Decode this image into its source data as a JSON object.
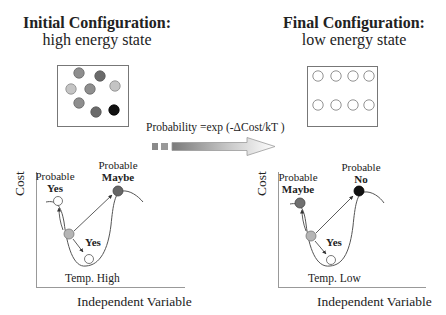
{
  "left": {
    "title_line1": "Initial Configuration:",
    "title_line2": "high energy state",
    "config_particles": [
      {
        "shade": "medium"
      },
      {
        "shade": "dark"
      },
      {
        "shade": "light"
      },
      {
        "shade": "medium"
      },
      {
        "shade": "light"
      },
      {
        "shade": "medium"
      },
      {
        "shade": "dark"
      },
      {
        "shade": "black"
      }
    ],
    "graph": {
      "y_axis_label": "Cost",
      "x_axis_label": "Independent Variable",
      "temperature_label": "Temp. High",
      "uphill_left_label_line1": "Probable",
      "uphill_left_label_line2": "Yes",
      "uphill_right_label_line1": "Probable",
      "uphill_right_label_line2": "Maybe",
      "downhill_label": "Yes"
    }
  },
  "right": {
    "title_line1": "Final Configuration:",
    "title_line2": "low energy state",
    "config_particles": [
      {
        "shade": "empty"
      },
      {
        "shade": "empty"
      },
      {
        "shade": "empty"
      },
      {
        "shade": "empty"
      },
      {
        "shade": "empty"
      },
      {
        "shade": "empty"
      },
      {
        "shade": "empty"
      },
      {
        "shade": "empty"
      }
    ],
    "graph": {
      "y_axis_label": "Cost",
      "x_axis_label": "Independent Variable",
      "temperature_label": "Temp. Low",
      "uphill_left_label_line1": "Probable",
      "uphill_left_label_line2": "Maybe",
      "uphill_right_label_line1": "Probable",
      "uphill_right_label_line2": "No",
      "downhill_label": "Yes"
    }
  },
  "transition": {
    "formula": "Probability =exp (-ΔCost/kT )"
  },
  "colors": {
    "light": "#c4c4c4",
    "medium": "#8e8e8e",
    "dark": "#6a6a6a",
    "black": "#111111",
    "line": "#555555"
  }
}
